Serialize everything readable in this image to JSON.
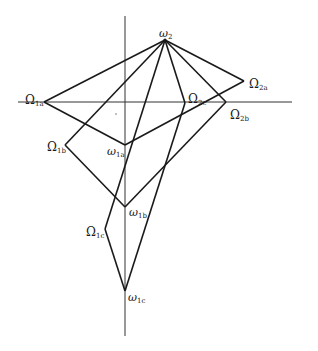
{
  "diagram": {
    "type": "geometric vector diagram",
    "axes": {
      "vertical": {
        "x": 125,
        "y1": 16,
        "y2": 336
      },
      "horizontal": {
        "y": 102,
        "x1": 18,
        "x2": 292
      }
    },
    "points": {
      "omega2": {
        "label": "ω",
        "sub": "2",
        "x": 165,
        "y": 40
      },
      "Omega1a": {
        "label": "Ω",
        "sub": "1a",
        "x": 44,
        "y": 102
      },
      "Omega2a": {
        "label": "Ω",
        "sub": "2a",
        "x": 244,
        "y": 81
      },
      "Omega2c": {
        "label": "Ω",
        "sub": "2c",
        "x": 185,
        "y": 103
      },
      "Omega2b": {
        "label": "Ω",
        "sub": "2b",
        "x": 226,
        "y": 102
      },
      "Omega1b": {
        "label": "Ω",
        "sub": "1b",
        "x": 65,
        "y": 145
      },
      "omega1a": {
        "label": "ω",
        "sub": "1a",
        "x": 125,
        "y": 145
      },
      "omega1b": {
        "label": "ω",
        "sub": "1b",
        "x": 125,
        "y": 207
      },
      "Omega1c": {
        "label": "Ω",
        "sub": "1c",
        "x": 105,
        "y": 229
      },
      "omega1c": {
        "label": "ω",
        "sub": "1c",
        "x": 125,
        "y": 291
      }
    },
    "segments": [
      [
        "omega2",
        "Omega1a"
      ],
      [
        "omega2",
        "Omega2a"
      ],
      [
        "omega2",
        "Omega2b"
      ],
      [
        "omega2",
        "Omega2c"
      ],
      [
        "omega2",
        "Omega1b"
      ],
      [
        "omega2",
        "Omega1c"
      ],
      [
        "Omega1a",
        "omega1a"
      ],
      [
        "omega1a",
        "Omega2a"
      ],
      [
        "Omega1b",
        "omega1b"
      ],
      [
        "omega1b",
        "Omega2b"
      ],
      [
        "Omega2c",
        "omega1c"
      ],
      [
        "Omega1c",
        "omega1c"
      ]
    ],
    "labels": {
      "omega2": {
        "sym": "ω",
        "sub": "2"
      },
      "Omega1a": {
        "sym": "Ω",
        "sub": "1a"
      },
      "Omega2a": {
        "sym": "Ω",
        "sub": "2a"
      },
      "Omega2c": {
        "sym": "Ω",
        "sub": "2c"
      },
      "Omega2b": {
        "sym": "Ω",
        "sub": "2b"
      },
      "Omega1b": {
        "sym": "Ω",
        "sub": "1b"
      },
      "omega1a": {
        "sym": "ω",
        "sub": "1a"
      },
      "omega1b": {
        "sym": "ω",
        "sub": "1b"
      },
      "Omega1c": {
        "sym": "Ω",
        "sub": "1c"
      },
      "omega1c": {
        "sym": "ω",
        "sub": "1c"
      }
    },
    "stroke_color": "#1a1a1a"
  }
}
